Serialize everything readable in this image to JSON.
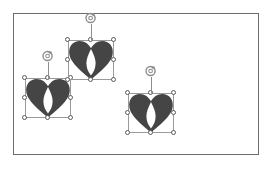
{
  "app": {
    "surface_label": "slide-canvas",
    "background_color": "#ffffff",
    "frame_border_color": "#6e6e6e"
  },
  "canvas": {
    "x": 13,
    "y": 13,
    "width": 246,
    "height": 142
  },
  "style": {
    "shape_fill_color": "#454545",
    "shape_inner_color": "#ffffff",
    "selection_box_color": "#9a9a9a",
    "handle_fill_color": "#ffffff",
    "handle_border_color": "#5a5a5a",
    "rotate_handle_color": "#8d8d8d"
  },
  "shapes": [
    {
      "id": "heart-shape-1",
      "name": "heart-shape-left",
      "icon": "heart-icon",
      "selected": true,
      "x": 25,
      "y": 78,
      "width": 46,
      "height": 40,
      "rotate_handle": {
        "icon": "rotate-icon",
        "stem_length": 16
      }
    },
    {
      "id": "heart-shape-2",
      "name": "heart-shape-top",
      "icon": "heart-icon",
      "selected": true,
      "x": 68,
      "y": 40,
      "width": 46,
      "height": 40,
      "rotate_handle": {
        "icon": "rotate-icon",
        "stem_length": 16
      }
    },
    {
      "id": "heart-shape-3",
      "name": "heart-shape-right",
      "icon": "heart-icon",
      "selected": true,
      "x": 128,
      "y": 93,
      "width": 46,
      "height": 40,
      "rotate_handle": {
        "icon": "rotate-icon",
        "stem_length": 16
      }
    }
  ],
  "handles": [
    {
      "name": "resize-handle-nw",
      "pos": "h-nw"
    },
    {
      "name": "resize-handle-n",
      "pos": "h-n"
    },
    {
      "name": "resize-handle-ne",
      "pos": "h-ne"
    },
    {
      "name": "resize-handle-w",
      "pos": "h-w"
    },
    {
      "name": "resize-handle-e",
      "pos": "h-e"
    },
    {
      "name": "resize-handle-sw",
      "pos": "h-sw"
    },
    {
      "name": "resize-handle-s",
      "pos": "h-s"
    },
    {
      "name": "resize-handle-se",
      "pos": "h-se"
    }
  ]
}
